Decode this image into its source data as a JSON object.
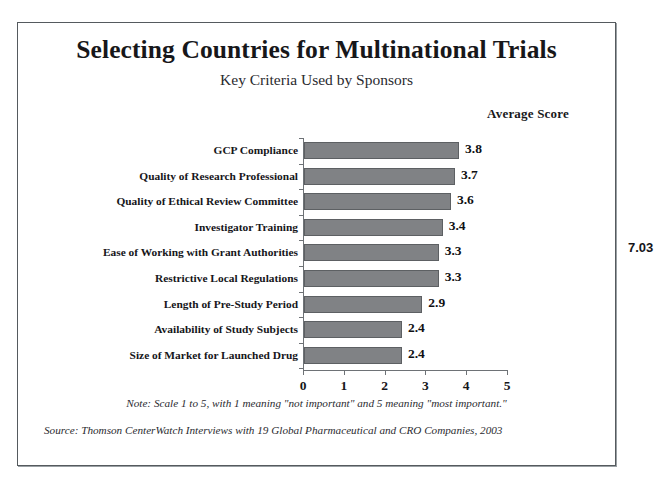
{
  "figure": {
    "title": "Selecting Countries for Multinational Trials",
    "subtitle": "Key Criteria Used by Sponsors",
    "value_axis_caption": "Average Score",
    "note": "Note: Scale 1 to 5, with 1 meaning \"not important\" and 5 meaning \"most important.\"",
    "source": "Source: Thomson CenterWatch Interviews with 19 Global Pharmaceutical and CRO Companies, 2003",
    "page_marker": "7.03",
    "bar_color": "#808285",
    "bar_edge_color": "#5d6063",
    "axis_color": "#6e7276",
    "frame_color": "#555a5e",
    "text_color": "#17171a"
  },
  "chart_data": {
    "type": "bar",
    "orientation": "horizontal",
    "title": "Selecting Countries for Multinational Trials",
    "subtitle": "Key Criteria Used by Sponsors",
    "xlabel": "Average Score",
    "ylabel": "",
    "xlim": [
      0,
      5
    ],
    "xticks": [
      0,
      1,
      2,
      3,
      4,
      5
    ],
    "xtick_labels": [
      "0",
      "1",
      "2",
      "3",
      "4",
      "5"
    ],
    "grid": false,
    "legend": false,
    "categories": [
      "GCP Compliance",
      "Quality of Research Professional",
      "Quality of Ethical Review Committee",
      "Investigator Training",
      "Ease of Working with Grant Authorities",
      "Restrictive Local Regulations",
      "Length of Pre-Study Period",
      "Availability of Study Subjects",
      "Size of Market for Launched Drug"
    ],
    "values": [
      3.8,
      3.7,
      3.6,
      3.4,
      3.3,
      3.3,
      2.9,
      2.4,
      2.4
    ],
    "value_labels": [
      "3.8",
      "3.7",
      "3.6",
      "3.4",
      "3.3",
      "3.3",
      "2.9",
      "2.4",
      "2.4"
    ]
  }
}
